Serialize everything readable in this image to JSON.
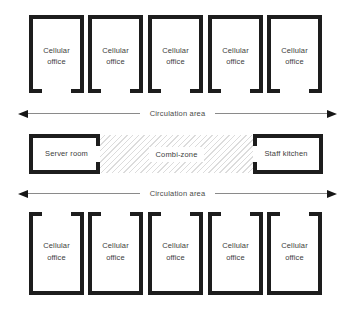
{
  "diagram": {
    "top_row": [
      {
        "label": "Cellular office"
      },
      {
        "label": "Cellular office"
      },
      {
        "label": "Cellular office"
      },
      {
        "label": "Cellular office"
      },
      {
        "label": "Cellular office"
      }
    ],
    "circulation_top": {
      "label": "Circulation area"
    },
    "middle": {
      "server": {
        "label": "Server room"
      },
      "combi": {
        "label": "Combi-zone"
      },
      "kitchen": {
        "label": "Staff kitchen"
      }
    },
    "circulation_bottom": {
      "label": "Circulation area"
    },
    "bottom_row": [
      {
        "label": "Cellular office"
      },
      {
        "label": "Cellular office"
      },
      {
        "label": "Cellular office"
      },
      {
        "label": "Cellular office"
      },
      {
        "label": "Cellular office"
      }
    ],
    "colors": {
      "wall": "#1d1d1d",
      "label_text": "#3d3d3d",
      "arrow_line": "#8a8a8a",
      "arrow_head": "#161616",
      "hatch_line": "#dcdcdc",
      "background": "#ffffff"
    }
  }
}
